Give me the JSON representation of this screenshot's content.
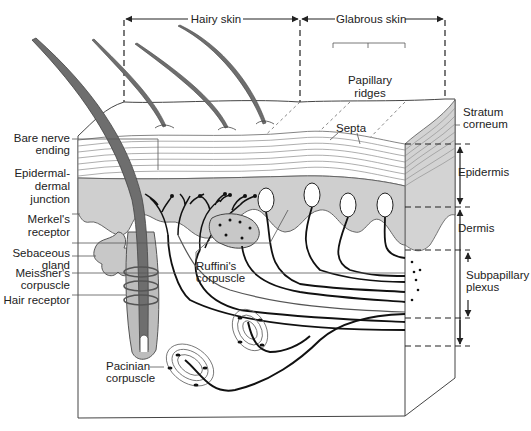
{
  "regions": {
    "hairy_skin": "Hairy skin",
    "glabrous_skin": "Glabrous skin"
  },
  "labels_top": {
    "papillary_ridges_1": "Papillary",
    "papillary_ridges_2": "ridges",
    "septa": "Septa"
  },
  "labels_left": {
    "bare_nerve_1": "Bare nerve",
    "bare_nerve_2": "ending",
    "ej_1": "Epidermal-",
    "ej_2": "dermal",
    "ej_3": "junction",
    "merkel_1": "Merkel's",
    "merkel_2": "receptor",
    "sebaceous_1": "Sebaceous",
    "sebaceous_2": "gland",
    "meissner_1": "Meissner's",
    "meissner_2": "corpuscle",
    "hair_receptor": "Hair receptor"
  },
  "labels_center": {
    "ruffini_1": "Ruffini's",
    "ruffini_2": "corpuscle",
    "pacinian_1": "Pacinian",
    "pacinian_2": "corpuscle"
  },
  "labels_right": {
    "stratum_1": "Stratum",
    "stratum_2": "corneum",
    "epidermis": "Epidermis",
    "dermis": "Dermis",
    "subpap_1": "Subpapillary",
    "subpap_2": "plexus"
  },
  "colors": {
    "tissue_gray": "#c8c8c8",
    "hair_dark": "#6e6e6e",
    "line": "#333333",
    "nerve": "#111111"
  }
}
